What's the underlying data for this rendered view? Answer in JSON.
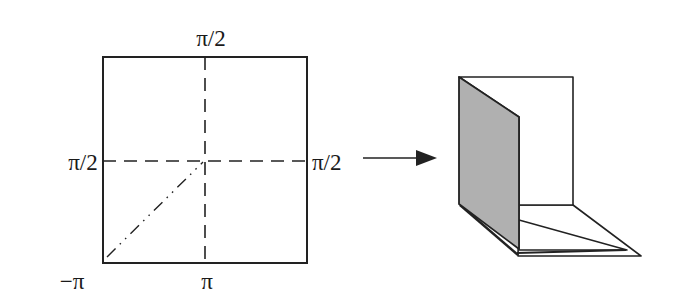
{
  "diagram": {
    "left_panel": {
      "name": "square-domain",
      "labels": {
        "top": "π/2",
        "left": "π/2",
        "right": "π/2",
        "bottom_left": "−π",
        "bottom_center": "π"
      },
      "lines": {
        "vertical_center": "dashed",
        "horizontal_center": "dashed",
        "diagonal": "dash-dot-dot, from bottom-left corner to center"
      }
    },
    "arrow": {
      "direction": "right",
      "meaning": "maps to"
    },
    "right_panel": {
      "name": "folded-paper-3d",
      "description": "Folded sheet: shaded gray flap folded up along the left edge, white upright back panel, white folded base with diagonal crease",
      "colors": {
        "shaded_flap": "#b0b0b0",
        "paper": "#ffffff",
        "outline": "#222222"
      }
    }
  }
}
